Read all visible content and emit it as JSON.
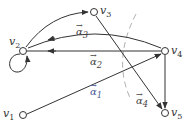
{
  "diagram": {
    "type": "directed-graph",
    "nodes": [
      {
        "id": "v1",
        "label": "v",
        "sub": "1",
        "x": 23,
        "y": 115
      },
      {
        "id": "v2",
        "label": "v",
        "sub": "2",
        "x": 23,
        "y": 51
      },
      {
        "id": "v3",
        "label": "v",
        "sub": "3",
        "x": 94,
        "y": 12
      },
      {
        "id": "v4",
        "label": "v",
        "sub": "4",
        "x": 165,
        "y": 51
      },
      {
        "id": "v5",
        "label": "v",
        "sub": "5",
        "x": 165,
        "y": 113
      }
    ],
    "edges": [
      {
        "from": "v2",
        "to": "v3",
        "shape": "curved"
      },
      {
        "from": "v4",
        "to": "v2",
        "shape": "curved",
        "label": "α3"
      },
      {
        "from": "v4",
        "to": "v2",
        "shape": "straight",
        "label": "α2"
      },
      {
        "from": "v1",
        "to": "v4",
        "shape": "straight",
        "label": "α1"
      },
      {
        "from": "v3",
        "to": "v5",
        "shape": "straight"
      },
      {
        "from": "v4",
        "to": "v5",
        "shape": "straight"
      },
      {
        "from": "v2",
        "to": "v2",
        "shape": "self-loop"
      }
    ],
    "cut": {
      "style": "dashed",
      "label": "α4"
    },
    "edge_labels": {
      "a1": {
        "sym": "α",
        "sub": "1",
        "arrow": "→"
      },
      "a2": {
        "sym": "α",
        "sub": "2",
        "arrow": "→"
      },
      "a3": {
        "sym": "α",
        "sub": "3",
        "arrow": "→"
      },
      "a4": {
        "sym": "α",
        "sub": "4",
        "arrow": "→"
      }
    },
    "colors": {
      "line": "#333333",
      "dashed": "#999999",
      "alpha1": "#4a5a9a"
    }
  }
}
